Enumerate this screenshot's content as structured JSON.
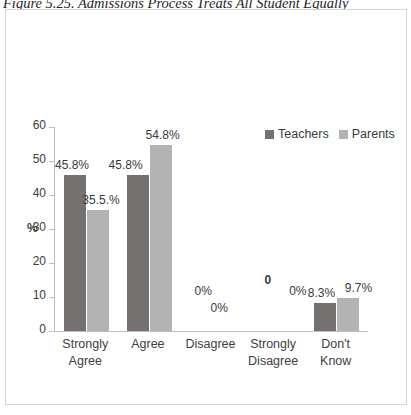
{
  "figure": {
    "caption": "Figure 5.25. Admissions Process Treats All Student Equally"
  },
  "legend": {
    "items": [
      {
        "label": "Teachers",
        "color": "#767171"
      },
      {
        "label": "Parents",
        "color": "#b3b3b3"
      }
    ]
  },
  "axis": {
    "y_title": "%",
    "y_ticks": [
      "0",
      "10",
      "20",
      "30",
      "40",
      "50",
      "60"
    ]
  },
  "labels": {
    "teachers": [
      "45.8%",
      "45.8%",
      "0%",
      "0",
      "8.3%"
    ],
    "parents": [
      "35.5.%",
      "54.8%",
      "0%",
      "0%",
      "9.7%"
    ]
  },
  "chart_data": {
    "type": "bar",
    "title": "Figure 5.25. Admissions Process Treats All Student Equally",
    "categories": [
      "Strongly Agree",
      "Agree",
      "Disagree",
      "Strongly Disagree",
      "Don't Know"
    ],
    "series": [
      {
        "name": "Teachers",
        "color": "#767171",
        "values": [
          45.8,
          45.8,
          0,
          0,
          8.3
        ]
      },
      {
        "name": "Parents",
        "color": "#b3b3b3",
        "values": [
          35.5,
          54.8,
          0,
          0,
          9.7
        ]
      }
    ],
    "xlabel": "",
    "ylabel": "%",
    "ylim": [
      0,
      60
    ],
    "ytick_step": 10,
    "grid": false,
    "legend_position": "top-right",
    "data_labels": true
  }
}
